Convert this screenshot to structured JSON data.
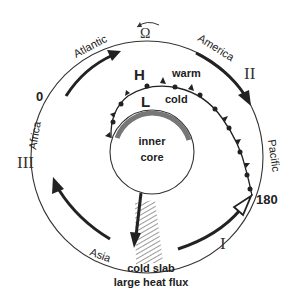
{
  "diagram": {
    "rotation_symbol": "Ω",
    "regions": {
      "atlantic": "Atlantic",
      "america": "America",
      "pacific": "Pacific",
      "asia": "Asia",
      "africa": "Africa"
    },
    "longitudes": {
      "zero": "0",
      "one_eighty": "180"
    },
    "stages": {
      "one": "I",
      "two": "II",
      "three": "III"
    },
    "front": {
      "high": "H",
      "low": "L",
      "warm": "warm",
      "cold": "cold"
    },
    "core": {
      "line1": "inner",
      "line2": "core"
    },
    "slab": {
      "line1": "cold slab",
      "line2": "large heat flux"
    }
  }
}
